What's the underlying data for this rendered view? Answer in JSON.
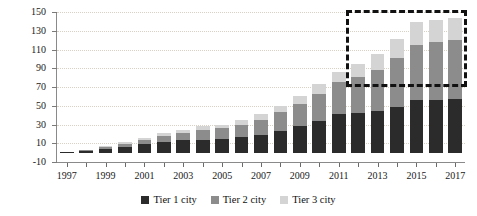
{
  "chart_data": {
    "type": "bar",
    "stacked": true,
    "title": "",
    "subtitle": "",
    "xlabel": "",
    "ylabel": "",
    "ylim": [
      -10,
      150
    ],
    "yticks": [
      -10,
      10,
      30,
      50,
      70,
      90,
      110,
      130,
      150
    ],
    "grid": true,
    "legend_position": "bottom",
    "categories": [
      "1997",
      "1998",
      "1999",
      "2000",
      "2001",
      "2002",
      "2003",
      "2004",
      "2005",
      "2006",
      "2007",
      "2008",
      "2009",
      "2010",
      "2011",
      "2012",
      "2013",
      "2014",
      "2015",
      "2016",
      "2017"
    ],
    "xtick_labels": [
      "1997",
      "1999",
      "2001",
      "2003",
      "2005",
      "2007",
      "2009",
      "2011",
      "2013",
      "2015",
      "2017"
    ],
    "series": [
      {
        "name": "Tier 1 city",
        "color": "#2b2b2b",
        "values": [
          1,
          2,
          4,
          6,
          9,
          11,
          13,
          14,
          15,
          17,
          19,
          23,
          28,
          34,
          41,
          42,
          44,
          49,
          56,
          56,
          57
        ]
      },
      {
        "name": "Tier 2 city",
        "color": "#8c8c8c",
        "values": [
          0,
          1,
          2,
          3,
          5,
          7,
          8,
          10,
          11,
          13,
          16,
          20,
          24,
          29,
          34,
          39,
          44,
          52,
          59,
          62,
          63
        ]
      },
      {
        "name": "Tier 3 city",
        "color": "#d4d4d4",
        "values": [
          0,
          0,
          1,
          2,
          2,
          3,
          3,
          4,
          4,
          5,
          6,
          7,
          8,
          10,
          11,
          14,
          17,
          20,
          24,
          24,
          24
        ]
      }
    ],
    "annotations": [
      {
        "name": "forecast-highlight-box",
        "style": "dashed-rectangle",
        "color": "#111111",
        "x_start_category": "2012",
        "x_end_category": "2017",
        "y_start": 70,
        "y_end": 152
      }
    ]
  },
  "legend": {
    "items": [
      {
        "label": "Tier 1 city",
        "color": "#2b2b2b"
      },
      {
        "label": "Tier 2 city",
        "color": "#8c8c8c"
      },
      {
        "label": "Tier 3 city",
        "color": "#d4d4d4"
      }
    ]
  },
  "axes": {
    "y": {
      "labels": [
        "150",
        "130",
        "110",
        "90",
        "70",
        "50",
        "30",
        "10",
        "-10"
      ]
    },
    "x": {
      "labels": [
        "1997",
        "1999",
        "2001",
        "2003",
        "2005",
        "2007",
        "2009",
        "2011",
        "2013",
        "2015",
        "2017"
      ]
    }
  }
}
